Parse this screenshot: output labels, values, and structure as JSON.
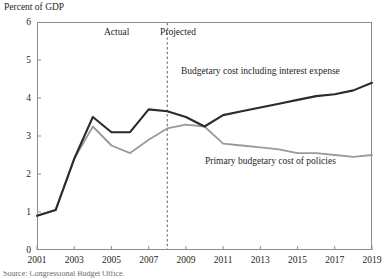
{
  "axis_title": "Percent of GDP",
  "annotations": {
    "actual": "Actual",
    "projected": "Projected",
    "series_dark": "Budgetary cost including interest expense",
    "series_gray": "Primary budgetary cost of policies"
  },
  "footnote": "Source: Congressional Budget Office.",
  "colors": {
    "series_dark": "#2b2b2b",
    "series_gray": "#9a9a9a",
    "frame": "#8d8d8d",
    "divider": "#6f6f6f",
    "text": "#231f20"
  },
  "chart_data": {
    "type": "line",
    "title": "",
    "subtitle": "",
    "xlabel": "",
    "ylabel": "Percent of GDP",
    "xlim": [
      2001,
      2019
    ],
    "ylim": [
      0,
      6
    ],
    "yticks": [
      0,
      1,
      2,
      3,
      4,
      5,
      6
    ],
    "ytick_labels": [
      "0",
      "1",
      "2",
      "3",
      "4",
      "5",
      "6"
    ],
    "xticks": [
      2001,
      2003,
      2005,
      2007,
      2009,
      2011,
      2013,
      2015,
      2017,
      2019
    ],
    "xtick_labels": [
      "2001",
      "2003",
      "2005",
      "2007",
      "2009",
      "2011",
      "2013",
      "2015",
      "2017",
      "2019"
    ],
    "grid": false,
    "legend_position": "inline-annotations",
    "x": [
      2001,
      2002,
      2003,
      2004,
      2005,
      2006,
      2007,
      2008,
      2009,
      2010,
      2011,
      2012,
      2013,
      2014,
      2015,
      2016,
      2017,
      2018,
      2019
    ],
    "series": [
      {
        "name": "Budgetary cost including interest expense",
        "color": "#2b2b2b",
        "values": [
          0.9,
          1.05,
          2.4,
          3.5,
          3.1,
          3.1,
          3.7,
          3.65,
          3.5,
          3.25,
          3.55,
          3.65,
          3.75,
          3.85,
          3.95,
          4.05,
          4.1,
          4.2,
          4.4
        ]
      },
      {
        "name": "Primary budgetary cost of policies",
        "color": "#9a9a9a",
        "values": [
          0.9,
          1.05,
          2.4,
          3.25,
          2.75,
          2.55,
          2.9,
          3.2,
          3.3,
          3.25,
          2.8,
          2.75,
          2.7,
          2.65,
          2.55,
          2.55,
          2.5,
          2.45,
          2.5
        ]
      }
    ],
    "divider": {
      "x": 2008,
      "style": "dashed",
      "left_label": "Actual",
      "right_label": "Projected"
    }
  }
}
